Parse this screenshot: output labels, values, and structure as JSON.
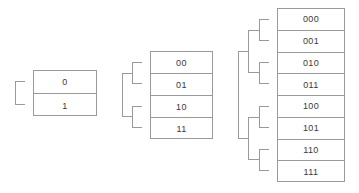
{
  "diagram": {
    "background_color": "#ffffff",
    "line_color": "#9a9a9a",
    "text_color": "#3a3a3a",
    "canvas": {
      "width": 359,
      "height": 193
    }
  },
  "groups": [
    {
      "id": "one-bit",
      "bits": 1,
      "label": "1-bit address space",
      "table": {
        "x": 33,
        "y": 70,
        "width": 64,
        "height": 46,
        "row_height": 23
      },
      "rows": [
        {
          "label": "0"
        },
        {
          "label": "1"
        }
      ],
      "brackets": [
        {
          "level": 1,
          "x": 15,
          "top": 81,
          "bottom": 105,
          "tip": 33,
          "stub": 10
        }
      ]
    },
    {
      "id": "two-bit",
      "bits": 2,
      "label": "2-bit address space",
      "table": {
        "x": 150,
        "y": 51,
        "width": 63,
        "height": 88,
        "row_height": 22
      },
      "rows": [
        {
          "label": "00"
        },
        {
          "label": "01"
        },
        {
          "label": "10"
        },
        {
          "label": "11"
        }
      ],
      "brackets": [
        {
          "level": 2,
          "x": 132,
          "top": 62,
          "bottom": 84,
          "tip": 150,
          "stub": 10
        },
        {
          "level": 2,
          "x": 132,
          "top": 106,
          "bottom": 128,
          "tip": 150,
          "stub": 10
        },
        {
          "level": 1,
          "x": 122,
          "top": 73,
          "bottom": 117,
          "tip": 132,
          "stub": 0
        }
      ]
    },
    {
      "id": "three-bit",
      "bits": 3,
      "label": "3-bit address space",
      "table": {
        "x": 277,
        "y": 8,
        "width": 68,
        "height": 174,
        "row_height": 21.75
      },
      "rows": [
        {
          "label": "000"
        },
        {
          "label": "001"
        },
        {
          "label": "010"
        },
        {
          "label": "011"
        },
        {
          "label": "100"
        },
        {
          "label": "101"
        },
        {
          "label": "110"
        },
        {
          "label": "111"
        }
      ],
      "brackets": [
        {
          "level": 3,
          "x": 259,
          "top": 18.9,
          "bottom": 40.6,
          "tip": 277,
          "stub": 10
        },
        {
          "level": 3,
          "x": 259,
          "top": 62.4,
          "bottom": 84.1,
          "tip": 277,
          "stub": 10
        },
        {
          "level": 3,
          "x": 259,
          "top": 105.9,
          "bottom": 127.6,
          "tip": 277,
          "stub": 10
        },
        {
          "level": 3,
          "x": 259,
          "top": 149.4,
          "bottom": 171.1,
          "tip": 277,
          "stub": 10
        },
        {
          "level": 2,
          "x": 248,
          "top": 29.7,
          "bottom": 73.2,
          "tip": 259,
          "stub": 0
        },
        {
          "level": 2,
          "x": 248,
          "top": 116.7,
          "bottom": 160.2,
          "tip": 259,
          "stub": 0
        },
        {
          "level": 1,
          "x": 238,
          "top": 51.5,
          "bottom": 138.5,
          "tip": 248,
          "stub": 0
        }
      ]
    }
  ]
}
